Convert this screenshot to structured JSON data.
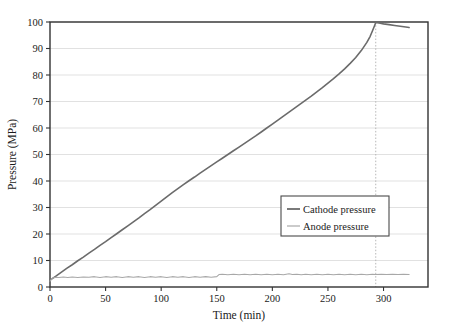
{
  "chart_data": {
    "type": "line",
    "title": "",
    "xlabel": "Time (min)",
    "ylabel": "Pressure (MPa)",
    "xlim": [
      0,
      340
    ],
    "ylim": [
      0,
      100
    ],
    "xticks": [
      0,
      50,
      100,
      150,
      200,
      250,
      300
    ],
    "yticks": [
      0,
      10,
      20,
      30,
      40,
      50,
      60,
      70,
      80,
      90,
      100
    ],
    "grid": "horizontal-gridlines-at-yticks, dotted-vertical-marker-at-293",
    "legend_position": "center-right",
    "annotations": [
      {
        "name": "end-of-charge-marker",
        "type": "vertical-dotted-line",
        "x": 293
      }
    ],
    "series": [
      {
        "name": "Cathode pressure",
        "color": "#6b6b6b",
        "linewidth": 1.6,
        "points": [
          [
            0,
            2.6
          ],
          [
            5,
            4.0
          ],
          [
            10,
            5.5
          ],
          [
            15,
            7.0
          ],
          [
            20,
            8.4
          ],
          [
            25,
            9.9
          ],
          [
            30,
            11.3
          ],
          [
            35,
            12.8
          ],
          [
            40,
            14.2
          ],
          [
            45,
            15.7
          ],
          [
            50,
            17.1
          ],
          [
            55,
            18.6
          ],
          [
            60,
            20.1
          ],
          [
            65,
            21.6
          ],
          [
            70,
            23.1
          ],
          [
            75,
            24.6
          ],
          [
            80,
            26.1
          ],
          [
            85,
            27.7
          ],
          [
            90,
            29.2
          ],
          [
            95,
            30.8
          ],
          [
            100,
            32.4
          ],
          [
            105,
            34.0
          ],
          [
            110,
            35.6
          ],
          [
            115,
            37.1
          ],
          [
            120,
            38.6
          ],
          [
            125,
            40.1
          ],
          [
            130,
            41.5
          ],
          [
            135,
            43.0
          ],
          [
            140,
            44.4
          ],
          [
            145,
            45.8
          ],
          [
            150,
            47.2
          ],
          [
            155,
            48.6
          ],
          [
            160,
            50.0
          ],
          [
            165,
            51.4
          ],
          [
            170,
            52.8
          ],
          [
            175,
            54.2
          ],
          [
            180,
            55.6
          ],
          [
            185,
            57.0
          ],
          [
            190,
            58.5
          ],
          [
            195,
            60.0
          ],
          [
            200,
            61.5
          ],
          [
            205,
            63.0
          ],
          [
            210,
            64.5
          ],
          [
            215,
            66.0
          ],
          [
            220,
            67.5
          ],
          [
            225,
            69.0
          ],
          [
            230,
            70.5
          ],
          [
            235,
            72.0
          ],
          [
            240,
            73.6
          ],
          [
            245,
            75.2
          ],
          [
            250,
            76.9
          ],
          [
            255,
            78.6
          ],
          [
            260,
            80.4
          ],
          [
            265,
            82.3
          ],
          [
            270,
            84.4
          ],
          [
            275,
            86.6
          ],
          [
            280,
            89.2
          ],
          [
            285,
            92.3
          ],
          [
            288,
            94.6
          ],
          [
            290,
            96.6
          ],
          [
            292,
            98.7
          ],
          [
            293,
            99.8
          ],
          [
            296,
            99.6
          ],
          [
            300,
            99.3
          ],
          [
            305,
            99.0
          ],
          [
            310,
            98.7
          ],
          [
            315,
            98.4
          ],
          [
            320,
            98.1
          ],
          [
            323,
            97.9
          ]
        ]
      },
      {
        "name": "Anode pressure",
        "color": "#a8a8a8",
        "linewidth": 1.1,
        "points": [
          [
            0,
            2.2
          ],
          [
            2,
            3.3
          ],
          [
            5,
            3.7
          ],
          [
            8,
            3.6
          ],
          [
            12,
            3.8
          ],
          [
            16,
            3.6
          ],
          [
            20,
            3.8
          ],
          [
            25,
            3.6
          ],
          [
            30,
            3.8
          ],
          [
            35,
            3.7
          ],
          [
            40,
            3.9
          ],
          [
            45,
            3.6
          ],
          [
            50,
            3.9
          ],
          [
            55,
            3.7
          ],
          [
            60,
            3.9
          ],
          [
            65,
            3.6
          ],
          [
            70,
            3.9
          ],
          [
            75,
            3.7
          ],
          [
            80,
            3.9
          ],
          [
            85,
            3.6
          ],
          [
            90,
            3.9
          ],
          [
            95,
            3.7
          ],
          [
            100,
            3.9
          ],
          [
            105,
            3.6
          ],
          [
            110,
            3.9
          ],
          [
            115,
            3.7
          ],
          [
            120,
            3.9
          ],
          [
            125,
            3.6
          ],
          [
            130,
            3.9
          ],
          [
            135,
            3.7
          ],
          [
            140,
            3.9
          ],
          [
            145,
            3.7
          ],
          [
            150,
            3.9
          ],
          [
            152,
            4.7
          ],
          [
            155,
            4.8
          ],
          [
            160,
            4.6
          ],
          [
            165,
            4.8
          ],
          [
            170,
            4.6
          ],
          [
            175,
            4.8
          ],
          [
            180,
            4.6
          ],
          [
            185,
            4.8
          ],
          [
            190,
            4.6
          ],
          [
            195,
            4.8
          ],
          [
            200,
            4.6
          ],
          [
            205,
            4.8
          ],
          [
            210,
            4.6
          ],
          [
            215,
            5.0
          ],
          [
            218,
            4.7
          ],
          [
            222,
            4.8
          ],
          [
            226,
            4.6
          ],
          [
            230,
            4.8
          ],
          [
            235,
            4.6
          ],
          [
            240,
            4.8
          ],
          [
            245,
            4.6
          ],
          [
            250,
            4.8
          ],
          [
            255,
            4.6
          ],
          [
            260,
            4.8
          ],
          [
            265,
            4.6
          ],
          [
            270,
            4.8
          ],
          [
            275,
            4.6
          ],
          [
            280,
            4.8
          ],
          [
            285,
            4.6
          ],
          [
            290,
            4.8
          ],
          [
            293,
            4.7
          ],
          [
            298,
            4.8
          ],
          [
            303,
            4.7
          ],
          [
            308,
            4.8
          ],
          [
            313,
            4.7
          ],
          [
            318,
            4.8
          ],
          [
            323,
            4.7
          ]
        ]
      }
    ]
  },
  "legend": {
    "items": [
      {
        "label": "Cathode pressure",
        "color": "#6b6b6b",
        "width": 1.8
      },
      {
        "label": "Anode pressure",
        "color": "#a8a8a8",
        "width": 1.2
      }
    ]
  },
  "axes": {
    "x_title": "Time (min)",
    "y_title": "Pressure (MPa)",
    "x_tick_labels": [
      "0",
      "50",
      "100",
      "150",
      "200",
      "250",
      "300"
    ],
    "y_tick_labels": [
      "0",
      "10",
      "20",
      "30",
      "40",
      "50",
      "60",
      "70",
      "80",
      "90",
      "100"
    ]
  },
  "colors": {
    "cathode": "#6b6b6b",
    "anode": "#a8a8a8",
    "axis": "#333333",
    "grid": "#d9d9d9",
    "text": "#1a1a1a",
    "background": "#ffffff"
  }
}
